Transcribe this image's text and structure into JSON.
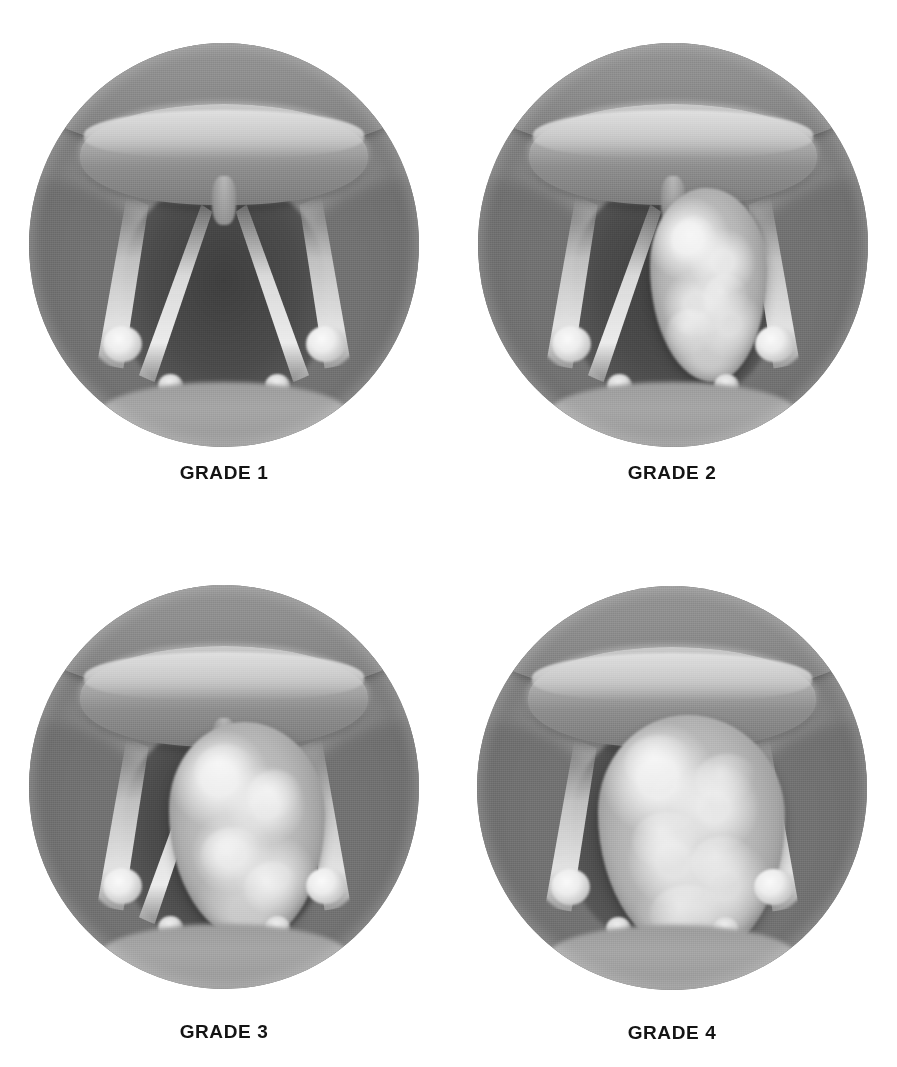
{
  "figure": {
    "layout": "2x2 grid of circular endoscopic views",
    "palette": {
      "background": "#ffffff",
      "mucosa_midtone": "#8a8a8a",
      "airway_shadow": "#4b4b4b",
      "cord_highlight": "#ebebeb",
      "mass_midtone": "#b6b6b6",
      "caption_text": "#141414"
    }
  },
  "panels": [
    {
      "id": "grade-1",
      "label": "GRADE 1",
      "position": "top-left",
      "mass_present": false,
      "obstruction_description": "Normal patent glottis; vocal cords form an open V, no obstructing lesion"
    },
    {
      "id": "grade-2",
      "label": "GRADE 2",
      "position": "top-right",
      "mass_present": true,
      "obstruction_description": "Lobulated mass occupying the right side of the glottic aperture"
    },
    {
      "id": "grade-3",
      "label": "GRADE 3",
      "position": "bottom-left",
      "mass_present": true,
      "obstruction_description": "Larger nodular mass filling much of the glottic aperture"
    },
    {
      "id": "grade-4",
      "label": "GRADE 4",
      "position": "bottom-right",
      "mass_present": true,
      "obstruction_description": "Bulky mass nearly occluding the glottic airway"
    }
  ]
}
